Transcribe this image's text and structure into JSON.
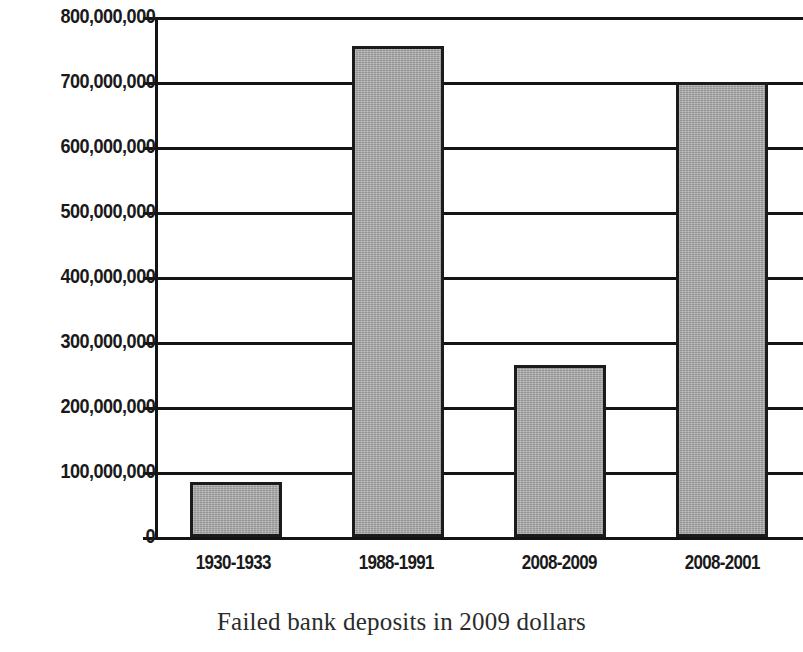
{
  "chart_data": {
    "type": "bar",
    "title": "",
    "caption": "Failed bank deposits in 2009 dollars",
    "xlabel": "",
    "ylabel": "",
    "categories": [
      "1930-1933",
      "1988-1991",
      "2008-2009",
      "2008-2001"
    ],
    "values": [
      85000000,
      755000000,
      265000000,
      700000000
    ],
    "ylim": [
      0,
      800000000
    ],
    "ytick_values": [
      0,
      100000000,
      200000000,
      300000000,
      400000000,
      500000000,
      600000000,
      700000000,
      800000000
    ],
    "ytick_labels": [
      "800,000,000",
      "700,000,000",
      "600,000,000",
      "500,000,000",
      "400,000,000",
      "300,000,000",
      "200,000,000",
      "100,000,000",
      "0"
    ],
    "grid": true,
    "legend": false,
    "bar_fill_color": "#a9a9a9",
    "bar_edge_color": "#1b1b1b",
    "axis_color": "#141414"
  },
  "axis": {
    "y_labels": {
      "t800": "800,000,000",
      "t700": "700,000,000",
      "t600": "600,000,000",
      "t500": "500,000,000",
      "t400": "400,000,000",
      "t300": "300,000,000",
      "t200": "200,000,000",
      "t100": "100,000,000",
      "t0": "0"
    },
    "x_labels": {
      "c1": "1930-1933",
      "c2": "1988-1991",
      "c3": "2008-2009",
      "c4": "2008-2001"
    }
  },
  "figure": {
    "caption": "Failed bank deposits in 2009 dollars"
  }
}
